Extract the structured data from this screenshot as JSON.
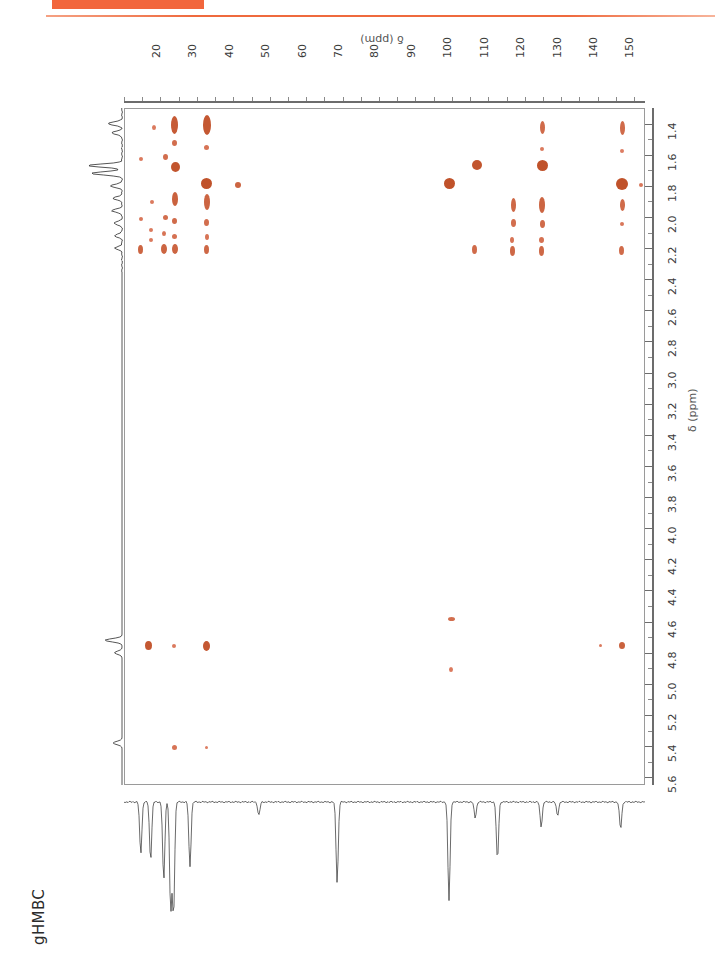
{
  "page": {
    "header_text": "",
    "accent_color": "#ef6a3e",
    "background": "#ffffff"
  },
  "figure": {
    "experiment_label": "gHMBC",
    "peak_color": "#c0522a",
    "peak_color_light": "#e9907a"
  },
  "chart_data": {
    "type": "scatter",
    "title": "gHMBC",
    "xlabel": "δ (ppm)",
    "ylabel": "δ (ppm)",
    "xlim": [
      14,
      157
    ],
    "ylim": [
      1.3,
      5.65
    ],
    "x_axis_position": "top",
    "y_axis_position": "right",
    "x_direction": "normal",
    "y_direction": "inverted",
    "grid": false,
    "legend": "none",
    "xticks": [
      20,
      30,
      40,
      50,
      60,
      70,
      80,
      90,
      100,
      110,
      120,
      130,
      140,
      150
    ],
    "xtick_labels": [
      "20",
      "30",
      "40",
      "50",
      "60",
      "70",
      "80",
      "90",
      "100",
      "110",
      "120",
      "130",
      "140",
      "150"
    ],
    "x_minor_step": 5,
    "yticks": [
      1.4,
      1.6,
      1.8,
      2.0,
      2.2,
      2.4,
      2.6,
      2.8,
      3.0,
      3.2,
      3.4,
      3.6,
      3.8,
      4.0,
      4.2,
      4.4,
      4.6,
      4.8,
      5.0,
      5.2,
      5.4,
      5.6
    ],
    "ytick_labels": [
      "1.4",
      "1.6",
      "1.8",
      "2.0",
      "2.2",
      "2.4",
      "2.6",
      "2.8",
      "3.0",
      "3.2",
      "3.4",
      "3.6",
      "3.8",
      "4.0",
      "4.2",
      "4.4",
      "4.6",
      "4.8",
      "5.0",
      "5.2",
      "5.4",
      "5.6"
    ],
    "y_minor_step": 0.1,
    "cross_peaks": [
      {
        "c": 22.0,
        "h": 1.42,
        "intensity": 0.35,
        "w": 4,
        "h_px": 5
      },
      {
        "c": 27.5,
        "h": 1.4,
        "intensity": 0.85,
        "w": 7,
        "h_px": 18
      },
      {
        "c": 27.5,
        "h": 1.52,
        "intensity": 0.55,
        "w": 5,
        "h_px": 6
      },
      {
        "c": 36.5,
        "h": 1.4,
        "intensity": 0.9,
        "w": 8,
        "h_px": 20
      },
      {
        "c": 36.5,
        "h": 1.55,
        "intensity": 0.45,
        "w": 5,
        "h_px": 5
      },
      {
        "c": 128.5,
        "h": 1.42,
        "intensity": 0.6,
        "w": 5,
        "h_px": 13
      },
      {
        "c": 128.5,
        "h": 1.56,
        "intensity": 0.35,
        "w": 4,
        "h_px": 4
      },
      {
        "c": 150.5,
        "h": 1.42,
        "intensity": 0.6,
        "w": 5,
        "h_px": 14
      },
      {
        "c": 150.5,
        "h": 1.57,
        "intensity": 0.3,
        "w": 4,
        "h_px": 4
      },
      {
        "c": 18.5,
        "h": 1.62,
        "intensity": 0.35,
        "w": 4,
        "h_px": 4
      },
      {
        "c": 25.0,
        "h": 1.61,
        "intensity": 0.55,
        "w": 5,
        "h_px": 6
      },
      {
        "c": 27.8,
        "h": 1.67,
        "intensity": 0.95,
        "w": 9,
        "h_px": 10
      },
      {
        "c": 110.5,
        "h": 1.66,
        "intensity": 0.95,
        "w": 10,
        "h_px": 10
      },
      {
        "c": 128.5,
        "h": 1.66,
        "intensity": 1.0,
        "w": 11,
        "h_px": 11
      },
      {
        "c": 36.5,
        "h": 1.78,
        "intensity": 1.0,
        "w": 11,
        "h_px": 11
      },
      {
        "c": 103.0,
        "h": 1.78,
        "intensity": 1.0,
        "w": 11,
        "h_px": 11
      },
      {
        "c": 150.5,
        "h": 1.78,
        "intensity": 1.0,
        "w": 12,
        "h_px": 12
      },
      {
        "c": 155.5,
        "h": 1.79,
        "intensity": 0.4,
        "w": 4,
        "h_px": 4
      },
      {
        "c": 45.0,
        "h": 1.79,
        "intensity": 0.7,
        "w": 6,
        "h_px": 6
      },
      {
        "c": 27.6,
        "h": 1.88,
        "intensity": 0.75,
        "w": 6,
        "h_px": 14
      },
      {
        "c": 36.5,
        "h": 1.9,
        "intensity": 0.7,
        "w": 6,
        "h_px": 16
      },
      {
        "c": 120.5,
        "h": 1.92,
        "intensity": 0.65,
        "w": 5,
        "h_px": 14
      },
      {
        "c": 128.5,
        "h": 1.92,
        "intensity": 0.7,
        "w": 6,
        "h_px": 16
      },
      {
        "c": 150.5,
        "h": 1.92,
        "intensity": 0.6,
        "w": 5,
        "h_px": 12
      },
      {
        "c": 21.5,
        "h": 1.9,
        "intensity": 0.35,
        "w": 4,
        "h_px": 4
      },
      {
        "c": 18.5,
        "h": 2.01,
        "intensity": 0.4,
        "w": 4,
        "h_px": 4
      },
      {
        "c": 25.0,
        "h": 2.0,
        "intensity": 0.55,
        "w": 5,
        "h_px": 5
      },
      {
        "c": 27.7,
        "h": 2.02,
        "intensity": 0.6,
        "w": 5,
        "h_px": 6
      },
      {
        "c": 36.4,
        "h": 2.03,
        "intensity": 0.55,
        "w": 5,
        "h_px": 7
      },
      {
        "c": 120.5,
        "h": 2.03,
        "intensity": 0.55,
        "w": 5,
        "h_px": 8
      },
      {
        "c": 128.5,
        "h": 2.04,
        "intensity": 0.6,
        "w": 5,
        "h_px": 8
      },
      {
        "c": 150.5,
        "h": 2.04,
        "intensity": 0.4,
        "w": 4,
        "h_px": 4
      },
      {
        "c": 21.0,
        "h": 2.08,
        "intensity": 0.35,
        "w": 4,
        "h_px": 4
      },
      {
        "c": 24.8,
        "h": 2.1,
        "intensity": 0.45,
        "w": 4,
        "h_px": 5
      },
      {
        "c": 27.6,
        "h": 2.12,
        "intensity": 0.5,
        "w": 5,
        "h_px": 5
      },
      {
        "c": 21.0,
        "h": 2.14,
        "intensity": 0.35,
        "w": 4,
        "h_px": 4
      },
      {
        "c": 36.4,
        "h": 2.12,
        "intensity": 0.45,
        "w": 4,
        "h_px": 6
      },
      {
        "c": 120.3,
        "h": 2.14,
        "intensity": 0.45,
        "w": 4,
        "h_px": 6
      },
      {
        "c": 128.3,
        "h": 2.14,
        "intensity": 0.5,
        "w": 5,
        "h_px": 6
      },
      {
        "c": 18.3,
        "h": 2.2,
        "intensity": 0.7,
        "w": 5,
        "h_px": 9
      },
      {
        "c": 24.8,
        "h": 2.2,
        "intensity": 0.7,
        "w": 6,
        "h_px": 10
      },
      {
        "c": 27.6,
        "h": 2.2,
        "intensity": 0.7,
        "w": 6,
        "h_px": 10
      },
      {
        "c": 36.4,
        "h": 2.2,
        "intensity": 0.65,
        "w": 5,
        "h_px": 9
      },
      {
        "c": 110.0,
        "h": 2.2,
        "intensity": 0.6,
        "w": 5,
        "h_px": 9
      },
      {
        "c": 120.3,
        "h": 2.21,
        "intensity": 0.65,
        "w": 5,
        "h_px": 10
      },
      {
        "c": 128.3,
        "h": 2.21,
        "intensity": 0.65,
        "w": 5,
        "h_px": 10
      },
      {
        "c": 150.3,
        "h": 2.21,
        "intensity": 0.6,
        "w": 5,
        "h_px": 9
      },
      {
        "c": 103.5,
        "h": 4.58,
        "intensity": 0.55,
        "w": 7,
        "h_px": 4
      },
      {
        "c": 20.5,
        "h": 4.75,
        "intensity": 0.9,
        "w": 7,
        "h_px": 9
      },
      {
        "c": 27.5,
        "h": 4.75,
        "intensity": 0.35,
        "w": 4,
        "h_px": 4
      },
      {
        "c": 36.5,
        "h": 4.75,
        "intensity": 0.9,
        "w": 7,
        "h_px": 10
      },
      {
        "c": 144.5,
        "h": 4.75,
        "intensity": 0.35,
        "w": 3,
        "h_px": 3
      },
      {
        "c": 150.5,
        "h": 4.75,
        "intensity": 0.75,
        "w": 6,
        "h_px": 7
      },
      {
        "c": 103.5,
        "h": 4.9,
        "intensity": 0.35,
        "w": 4,
        "h_px": 5
      },
      {
        "c": 27.5,
        "h": 5.4,
        "intensity": 0.45,
        "w": 5,
        "h_px": 5
      },
      {
        "c": 36.5,
        "h": 5.4,
        "intensity": 0.3,
        "w": 3,
        "h_px": 3
      }
    ],
    "proton_projection_peaks": [
      {
        "h": 1.4,
        "height": 0.42
      },
      {
        "h": 1.46,
        "height": 0.3
      },
      {
        "h": 1.67,
        "height": 1.0
      },
      {
        "h": 1.72,
        "height": 0.92
      },
      {
        "h": 1.8,
        "height": 0.34
      },
      {
        "h": 1.88,
        "height": 0.26
      },
      {
        "h": 1.96,
        "height": 0.3
      },
      {
        "h": 2.04,
        "height": 0.24
      },
      {
        "h": 2.12,
        "height": 0.22
      },
      {
        "h": 2.2,
        "height": 0.2
      },
      {
        "h": 4.72,
        "height": 0.5
      },
      {
        "h": 4.8,
        "height": 0.22
      },
      {
        "h": 5.38,
        "height": 0.26
      }
    ],
    "carbon_projection_peaks": [
      {
        "c": 18.6,
        "depth": 0.46
      },
      {
        "c": 21.3,
        "depth": 0.52
      },
      {
        "c": 24.9,
        "depth": 0.7
      },
      {
        "c": 26.8,
        "depth": 0.96
      },
      {
        "c": 27.6,
        "depth": 1.0
      },
      {
        "c": 32.1,
        "depth": 0.58
      },
      {
        "c": 51.0,
        "depth": 0.12
      },
      {
        "c": 72.5,
        "depth": 0.72
      },
      {
        "c": 103.2,
        "depth": 0.88
      },
      {
        "c": 110.4,
        "depth": 0.14
      },
      {
        "c": 116.5,
        "depth": 0.52
      },
      {
        "c": 128.5,
        "depth": 0.22
      },
      {
        "c": 133.0,
        "depth": 0.12
      },
      {
        "c": 150.3,
        "depth": 0.24
      }
    ]
  }
}
